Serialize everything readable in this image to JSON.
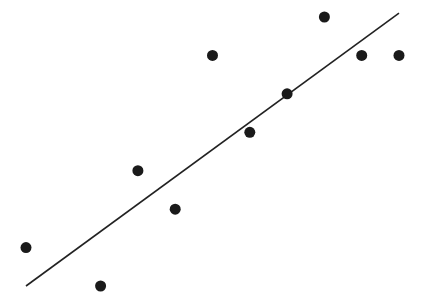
{
  "chart_data": {
    "type": "scatter",
    "title": "",
    "xlabel": "",
    "ylabel": "",
    "grid": false,
    "legend": null,
    "axes_visible": false,
    "points": [
      {
        "x": 1,
        "y": 2
      },
      {
        "x": 3,
        "y": 1
      },
      {
        "x": 4,
        "y": 4
      },
      {
        "x": 5,
        "y": 3
      },
      {
        "x": 6,
        "y": 7
      },
      {
        "x": 7,
        "y": 5
      },
      {
        "x": 8,
        "y": 6
      },
      {
        "x": 9,
        "y": 8
      },
      {
        "x": 10,
        "y": 7
      },
      {
        "x": 11,
        "y": 7
      }
    ],
    "x": [
      1,
      3,
      4,
      5,
      6,
      7,
      8,
      9,
      10,
      11
    ],
    "y": [
      2,
      1,
      4,
      3,
      7,
      5,
      6,
      8,
      7,
      7
    ],
    "trendline": {
      "type": "linear",
      "x_start": 1,
      "y_start": 1.0,
      "x_end": 11,
      "y_end": 8.1
    },
    "xlim": [
      0.4,
      11.7
    ],
    "ylim": [
      0.6,
      8.4
    ],
    "marker_color": "#1a1a1a",
    "line_color": "#222222"
  }
}
